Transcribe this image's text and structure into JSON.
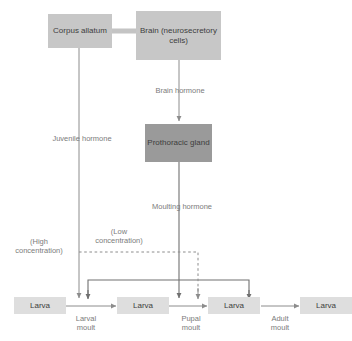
{
  "diagram": {
    "colors": {
      "box_light": "#c7c7c7",
      "box_dark": "#9a9a9a",
      "box_pale": "#dedede",
      "line": "#8c8c8c",
      "line_dark": "#707070",
      "label_text": "#7b7b7b",
      "box_text": "#3d3d3d",
      "background": "#ffffff"
    },
    "nodes": {
      "corpus_allatum": "Corpus\nallatum",
      "brain": "Brain\n(neurosecretory\ncells)",
      "prothoracic_gland": "Prothoracic\ngland",
      "larva_1": "Larva",
      "larva_2": "Larva",
      "larva_3": "Larva",
      "larva_4": "Larva"
    },
    "edge_labels": {
      "brain_hormone": "Brain hormone",
      "juvenile_hormone": "Juvenile hormone",
      "moulting_hormone": "Moulting hormone",
      "high_concentration": "(High\nconcentration)",
      "low_concentration": "(Low\nconcentration)",
      "larval_moult": "Larval\nmoult",
      "pupal_moult": "Pupal\nmoult",
      "adult_moult": "Adult\nmoult"
    },
    "caption": ""
  }
}
